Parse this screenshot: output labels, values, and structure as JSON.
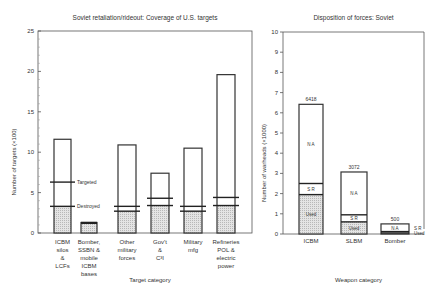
{
  "chart_data": [
    {
      "type": "bar",
      "title": "Soviet retaliation/rideout: Coverage of U.S. targets",
      "xlabel": "Target category",
      "ylabel": "Number of targets (×100)",
      "ylim": [
        0,
        25
      ],
      "yticks": [
        0,
        5,
        10,
        15,
        20,
        25
      ],
      "grid": false,
      "categories": [
        "ICBM silos & LCFs",
        "Bomber, SSBN & mobile ICBM bases",
        "Other military forces",
        "Gov't & C³I",
        "Military mfg",
        "Refineries POL & electric power"
      ],
      "category_lines": [
        [
          "ICBM",
          "silos",
          "&",
          "LCFs"
        ],
        [
          "Bomber,",
          "SSBN &",
          "mobile",
          "ICBM",
          "bases"
        ],
        [
          "Other",
          "military",
          "forces"
        ],
        [
          "Gov't",
          "&",
          "C³I"
        ],
        [
          "Military",
          "mfg"
        ],
        [
          "Refineries",
          "POL &",
          "electric",
          "power"
        ]
      ],
      "series": [
        {
          "name": "Total targets",
          "values": [
            11.6,
            1.3,
            10.9,
            7.4,
            10.5,
            19.6
          ]
        },
        {
          "name": "Targeted",
          "values": [
            6.3,
            1.3,
            3.3,
            4.3,
            3.3,
            4.4
          ]
        },
        {
          "name": "Destroyed",
          "values": [
            3.3,
            1.2,
            2.7,
            3.4,
            2.7,
            3.4
          ]
        }
      ],
      "annotations": [
        "Targeted",
        "Destroyed"
      ]
    },
    {
      "type": "bar",
      "title": "Disposition of forces: Soviet",
      "xlabel": "Weapon category",
      "ylabel": "Number of warheads (×1000)",
      "ylim": [
        0,
        10
      ],
      "yticks": [
        0,
        1,
        2,
        3,
        4,
        5,
        6,
        7,
        8,
        9,
        10
      ],
      "grid": false,
      "categories": [
        "ICBM",
        "SLBM",
        "Bomber"
      ],
      "totals_labels": [
        "6418",
        "3072",
        "500"
      ],
      "series": [
        {
          "name": "Used",
          "values": [
            1.95,
            0.6,
            0.05
          ]
        },
        {
          "name": "S R",
          "values": [
            0.55,
            0.35,
            0.07
          ]
        },
        {
          "name": "N A",
          "values": [
            3.92,
            2.12,
            0.38
          ]
        }
      ],
      "segment_labels": {
        "used": "Used",
        "sr": "S R",
        "na": "N A"
      }
    }
  ]
}
